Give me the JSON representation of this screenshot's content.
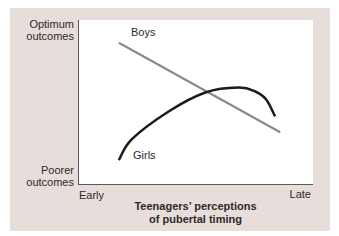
{
  "figure": {
    "background": "#ffffff",
    "panel_color": "#e7dedc",
    "text_color": "#2d2a26",
    "axis_color": "#5a5b5e"
  },
  "chart_data": {
    "type": "line",
    "title": "",
    "xlabel_lines": [
      "Teenagers’ perceptions",
      "of pubertal timing"
    ],
    "y_axis_labels": {
      "top": [
        "Optimum",
        "outcomes"
      ],
      "bottom": [
        "Poorer",
        "outcomes"
      ]
    },
    "x_tick_labels": {
      "left": "Early",
      "right": "Late"
    },
    "axis_ranges": {
      "x": [
        0,
        1
      ],
      "y": [
        0,
        1
      ]
    },
    "grid": false,
    "legend_position": "inline-labels",
    "series": [
      {
        "name": "Boys",
        "color": "#8a8b8d",
        "shape": "straight declining line",
        "points": [
          [
            0.17,
            0.861
          ],
          [
            0.86,
            0.315
          ]
        ]
      },
      {
        "name": "Girls",
        "color": "#1b1b1b",
        "shape": "skewed inverted-U curve",
        "points": [
          [
            0.17,
            0.145
          ],
          [
            0.226,
            0.273
          ],
          [
            0.383,
            0.442
          ],
          [
            0.54,
            0.558
          ],
          [
            0.681,
            0.588
          ],
          [
            0.753,
            0.564
          ],
          [
            0.8,
            0.515
          ],
          [
            0.838,
            0.412
          ]
        ]
      }
    ]
  }
}
